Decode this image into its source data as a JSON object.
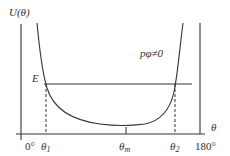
{
  "diagram": {
    "y_axis_label": "U(θ)",
    "x_axis_label": "θ",
    "energy_label": "E",
    "curve_annotation": "pφ≠0",
    "x_ticks": {
      "left": "0°",
      "theta1": "θ",
      "theta1_sub": "1",
      "theta_m": "θ",
      "theta_m_sub": "m",
      "theta2": "θ",
      "theta2_sub": "2",
      "right": "180°"
    },
    "colors": {
      "line": "#333333",
      "background": "#ffffff"
    }
  }
}
